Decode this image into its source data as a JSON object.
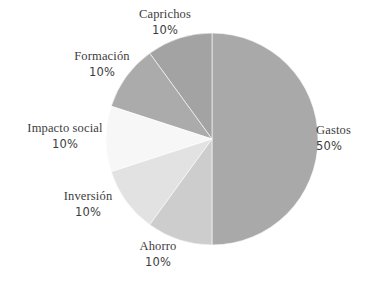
{
  "chart_data": {
    "type": "pie",
    "title": "",
    "subtitle": "",
    "xlabel": "",
    "ylabel": "",
    "legend_position": "none",
    "labels_position": "outside",
    "grid": false,
    "start_angle_deg": 90,
    "direction": "counterclockwise",
    "units": "%",
    "categories": [
      "Gastos",
      "Caprichos",
      "Formación",
      "Impacto social",
      "Inversión",
      "Ahorro"
    ],
    "values": [
      50,
      10,
      10,
      10,
      10,
      10
    ],
    "slices": [
      {
        "id": "gastos",
        "label": "Gastos",
        "value": 50,
        "value_text": "50%",
        "color": "#a9a9a9",
        "start_deg": 270,
        "end_deg": 450
      },
      {
        "id": "caprichos",
        "label": "Caprichos",
        "value": 10,
        "value_text": "10%",
        "color": "#a3a3a3",
        "start_deg": 90,
        "end_deg": 126
      },
      {
        "id": "formacion",
        "label": "Formación",
        "value": 10,
        "value_text": "10%",
        "color": "#ababab",
        "start_deg": 126,
        "end_deg": 162
      },
      {
        "id": "impacto-social",
        "label": "Impacto social",
        "value": 10,
        "value_text": "10%",
        "color": "#f7f7f7",
        "start_deg": 162,
        "end_deg": 198
      },
      {
        "id": "inversion",
        "label": "Inversión",
        "value": 10,
        "value_text": "10%",
        "color": "#e2e2e2",
        "start_deg": 198,
        "end_deg": 234
      },
      {
        "id": "ahorro",
        "label": "Ahorro",
        "value": 10,
        "value_text": "10%",
        "color": "#cdcdcd",
        "start_deg": 234,
        "end_deg": 270
      }
    ],
    "geometry": {
      "center_x": 212,
      "center_y": 139,
      "radius": 106
    },
    "background_color": "#ffffff",
    "text_color": "#3c3c3c"
  }
}
